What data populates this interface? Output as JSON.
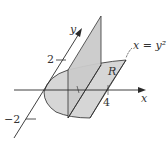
{
  "figure": {
    "axes": {
      "x_label": "x",
      "y_label": "y"
    },
    "ticks": {
      "y_pos": "2",
      "y_neg": "−2",
      "x_val": "4"
    },
    "curve_label": "x = y²",
    "region_label": "R",
    "colors": {
      "fill_region": "#d4d4d4",
      "fill_plane": "#cfcfcf",
      "line": "#2a2a2a"
    }
  }
}
